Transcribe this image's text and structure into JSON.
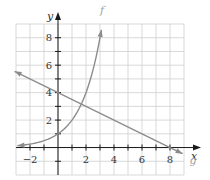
{
  "chart_data": {
    "type": "line",
    "title": "",
    "xlabel": "x",
    "ylabel": "y",
    "xlim": [
      -3,
      9
    ],
    "ylim": [
      -2,
      9
    ],
    "grid": true,
    "grid_step": 1,
    "x_ticks": [
      -2,
      -1,
      1,
      2,
      3,
      4,
      5,
      6,
      7,
      8
    ],
    "y_ticks": [
      -1,
      1,
      2,
      3,
      4,
      5,
      6,
      7,
      8
    ],
    "x_tick_labels": [
      {
        "value": -2,
        "label": "−2"
      },
      {
        "value": 2,
        "label": "2"
      },
      {
        "value": 4,
        "label": "4"
      },
      {
        "value": 6,
        "label": "6"
      },
      {
        "value": 8,
        "label": "8"
      }
    ],
    "y_tick_labels": [
      {
        "value": 2,
        "label": "2"
      },
      {
        "value": 4,
        "label": "4"
      },
      {
        "value": 6,
        "label": "6"
      },
      {
        "value": 8,
        "label": "8"
      }
    ],
    "series": [
      {
        "name": "f",
        "label": "f",
        "kind": "exponential",
        "equation": "y = 2^x",
        "color": "#8c8c8c",
        "x": [
          -2.9,
          -2,
          -1,
          0,
          1,
          1.5,
          2,
          2.5,
          3.1
        ],
        "values": [
          0.13,
          0.25,
          0.5,
          1,
          2,
          2.83,
          4,
          5.66,
          8.57
        ],
        "label_position": {
          "x": 3.0,
          "y": 9.7
        }
      },
      {
        "name": "g",
        "label": "g",
        "kind": "linear",
        "equation": "y = 4 - x/2",
        "color": "#8c8c8c",
        "x": [
          -3.1,
          0,
          8,
          8.9
        ],
        "values": [
          5.55,
          4,
          0,
          -0.45
        ],
        "label_position": {
          "x": 9.4,
          "y": -1.2
        }
      }
    ],
    "legend": "none (curves labeled inline)"
  }
}
